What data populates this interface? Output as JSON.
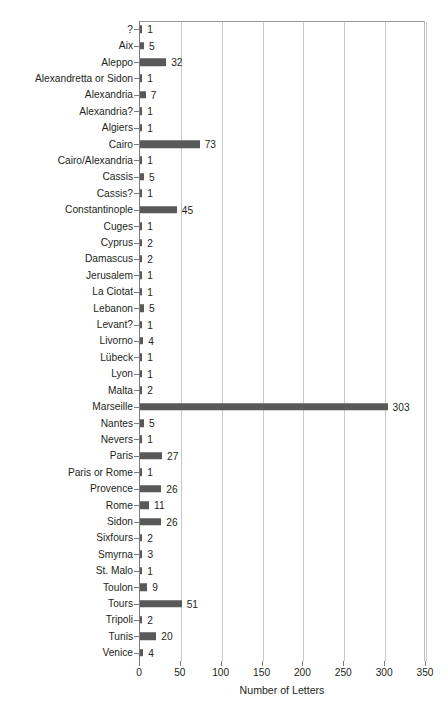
{
  "page_header": {
    "left_text": "",
    "right_text": ""
  },
  "chart_data": {
    "type": "bar",
    "orientation": "horizontal",
    "title": "",
    "subtitle": "",
    "xlabel": "Number of Letters",
    "ylabel": "",
    "xlim": [
      0,
      350
    ],
    "xticks": [
      0,
      50,
      100,
      150,
      200,
      250,
      300,
      350
    ],
    "xtick_labels": [
      "0",
      "50",
      "100",
      "150",
      "200",
      "250",
      "300",
      "350"
    ],
    "grid": "vertical",
    "legend": null,
    "bar_color": "#595959",
    "axis_color": "#7d7d7d",
    "gridline_color": "#c9c9c9",
    "categories": [
      "?",
      "Aix",
      "Aleppo",
      "Alexandretta or Sidon",
      "Alexandria",
      "Alexandria?",
      "Algiers",
      "Cairo",
      "Cairo/Alexandria",
      "Cassis",
      "Cassis?",
      "Constantinople",
      "Cuges",
      "Cyprus",
      "Damascus",
      "Jerusalem",
      "La Ciotat",
      "Lebanon",
      "Levant?",
      "Livorno",
      "Lübeck",
      "Lyon",
      "Malta",
      "Marseille",
      "Nantes",
      "Nevers",
      "Paris",
      "Paris or Rome",
      "Provence",
      "Rome",
      "Sidon",
      "Sixfours",
      "Smyrna",
      "St. Malo",
      "Toulon",
      "Tours",
      "Tripoli",
      "Tunis",
      "Venice"
    ],
    "values": [
      1,
      5,
      32,
      1,
      7,
      1,
      1,
      73,
      1,
      5,
      1,
      45,
      1,
      2,
      2,
      1,
      1,
      5,
      1,
      4,
      1,
      1,
      2,
      303,
      5,
      1,
      27,
      1,
      26,
      11,
      26,
      2,
      3,
      1,
      9,
      51,
      2,
      20,
      4
    ],
    "value_labels": [
      "1",
      "5",
      "32",
      "1",
      "7",
      "1",
      "1",
      "73",
      "1",
      "5",
      "1",
      "45",
      "1",
      "2",
      "2",
      "1",
      "1",
      "5",
      "1",
      "4",
      "1",
      "1",
      "2",
      "303",
      "5",
      "1",
      "27",
      "1",
      "26",
      "11",
      "26",
      "2",
      "3",
      "1",
      "9",
      "51",
      "2",
      "20",
      "4"
    ]
  }
}
